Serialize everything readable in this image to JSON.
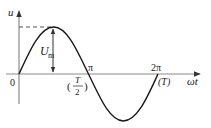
{
  "diagram": {
    "type": "sine-wave",
    "axes": {
      "y_label": "u",
      "x_label": "ωt",
      "origin_label": "0"
    },
    "amplitude_label": {
      "main": "U",
      "sub": "m"
    },
    "ticks": [
      {
        "label": "π",
        "alt_label_num": "T",
        "alt_label_den": "2"
      },
      {
        "label": "2π",
        "alt_label": "(T)"
      }
    ],
    "colors": {
      "curve": "#1a1a1a",
      "axis": "#8a8a8a",
      "dash": "#555555"
    }
  }
}
